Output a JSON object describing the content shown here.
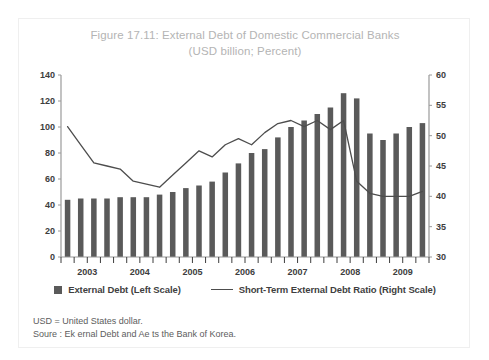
{
  "figure": {
    "title_line1": "Figure 17.11: External Debt of Domestic Commercial Banks",
    "title_line2": "(USD billion; Percent)"
  },
  "legend": {
    "bar_label": "External Debt (Left Scale)",
    "line_label": "Short-Term External Debt Ratio (Right Scale)"
  },
  "footnote": {
    "line1": "USD = United States dollar.",
    "line2": "Soure  : Ek ernal Debt and Ae    ts  the Bank of Korea."
  },
  "colors": {
    "bar": "#5a5a5a",
    "line": "#4d4d4d",
    "axis": "#9a9a9a",
    "title": "#b4b4b4",
    "frame": "#efefef",
    "tick_text": "#3d3d3d"
  },
  "chart_data": {
    "type": "bar",
    "title": "Figure 17.11: External Debt of Domestic Commercial Banks",
    "subtitle": "(USD billion; Percent)",
    "xlabel": "",
    "ylabel": "USD billion",
    "y2label": "Percent",
    "ylim": [
      0,
      140
    ],
    "y2lim": [
      30,
      60
    ],
    "yticks": [
      0,
      20,
      40,
      60,
      80,
      100,
      120,
      140
    ],
    "y2ticks": [
      30,
      35,
      40,
      45,
      50,
      55,
      60
    ],
    "grid": false,
    "legend_position": "bottom",
    "year_labels": [
      "2003",
      "2004",
      "2005",
      "2006",
      "2007",
      "2008",
      "2009"
    ],
    "categories": [
      "2003Q1",
      "2003Q2",
      "2003Q3",
      "2003Q4",
      "2004Q1",
      "2004Q2",
      "2004Q3",
      "2004Q4",
      "2005Q1",
      "2005Q2",
      "2005Q3",
      "2005Q4",
      "2006Q1",
      "2006Q2",
      "2006Q3",
      "2006Q4",
      "2007Q1",
      "2007Q2",
      "2007Q3",
      "2007Q4",
      "2008Q1",
      "2008Q2",
      "2008Q3",
      "2008Q4",
      "2009Q1",
      "2009Q2",
      "2009Q3",
      "2009Q4"
    ],
    "series": [
      {
        "name": "External Debt (Left Scale)",
        "type": "bar",
        "axis": "left",
        "unit": "USD billion",
        "values": [
          44,
          45,
          45,
          45,
          46,
          46,
          46,
          48,
          50,
          53,
          55,
          58,
          65,
          72,
          80,
          83,
          92,
          100,
          105,
          110,
          115,
          126,
          122,
          95,
          90,
          95,
          100,
          103
        ]
      },
      {
        "name": "Short-Term External Debt Ratio (Right Scale)",
        "type": "line",
        "axis": "right",
        "unit": "Percent",
        "values": [
          51.5,
          48.5,
          45.5,
          45.0,
          44.5,
          42.5,
          42.0,
          41.5,
          43.5,
          45.5,
          47.5,
          46.5,
          48.5,
          49.5,
          48.5,
          50.5,
          52.0,
          52.5,
          51.5,
          52.5,
          51.0,
          52.5,
          42.5,
          40.5,
          40.0,
          40.0,
          40.0,
          40.8
        ]
      }
    ]
  }
}
